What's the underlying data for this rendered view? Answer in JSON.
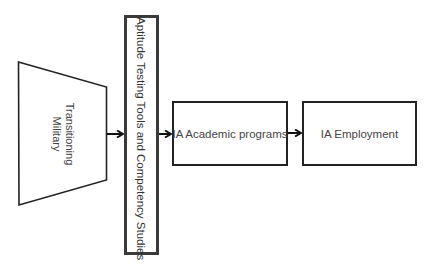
{
  "diagram": {
    "type": "flow",
    "direction": "left-to-right",
    "nodes": [
      {
        "id": "military",
        "shape": "trapezoid",
        "label_lines": [
          "Transitioning",
          "Military"
        ],
        "text_orientation": "rotated-90"
      },
      {
        "id": "aptitude",
        "shape": "tall-rectangle-thick-border",
        "label": "Aptitude Testing Tools and Competency Studies",
        "text_orientation": "rotated-90"
      },
      {
        "id": "academic",
        "shape": "rectangle",
        "label": "IA Academic programs"
      },
      {
        "id": "employment",
        "shape": "rectangle",
        "label": "IA Employment"
      }
    ],
    "edges": [
      {
        "from": "military",
        "to": "aptitude"
      },
      {
        "from": "aptitude",
        "to": "academic"
      },
      {
        "from": "academic",
        "to": "employment"
      }
    ]
  },
  "labels": {
    "military_line1": "Transitioning",
    "military_line2": "Military",
    "aptitude": "Aptitude Testing Tools and Competency Studies",
    "academic": "IA Academic programs",
    "employment": "IA Employment"
  },
  "colors": {
    "stroke": "#222222",
    "thick_border": "#3a3a3a",
    "text": "#444444",
    "background": "#ffffff"
  }
}
